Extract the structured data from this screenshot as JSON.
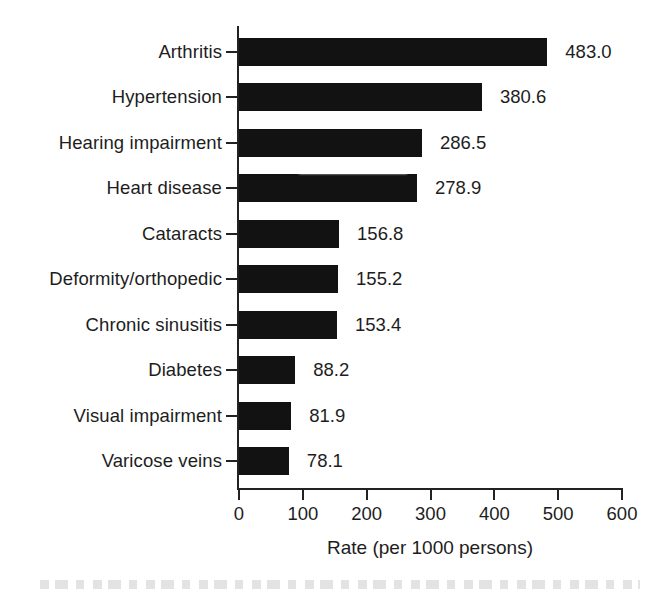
{
  "chart_data": {
    "type": "bar",
    "orientation": "horizontal",
    "title": "",
    "subtitle": "",
    "xlabel": "Rate (per 1000 persons)",
    "ylabel": "",
    "xlim": [
      0,
      600
    ],
    "xticks": [
      0,
      100,
      200,
      300,
      400,
      500,
      600
    ],
    "xtick_labels": [
      "0",
      "100",
      "200",
      "300",
      "400",
      "500",
      "600"
    ],
    "grid": false,
    "legend": null,
    "bar_color": "#121212",
    "categories": [
      "Arthritis",
      "Hypertension",
      "Hearing impairment",
      "Heart disease",
      "Cataracts",
      "Deformity/orthopedic",
      "Chronic sinusitis",
      "Diabetes",
      "Visual impairment",
      "Varicose veins"
    ],
    "values": [
      483.0,
      380.6,
      286.5,
      278.9,
      156.8,
      155.2,
      153.4,
      88.2,
      81.9,
      78.1
    ],
    "data_labels": [
      "483.0",
      "380.6",
      "286.5",
      "278.9",
      "156.8",
      "155.2",
      "153.4",
      "88.2",
      "81.9",
      "78.1"
    ],
    "bars": [
      {
        "category": "Arthritis",
        "value": 483.0,
        "label": "483.0"
      },
      {
        "category": "Hypertension",
        "value": 380.6,
        "label": "380.6"
      },
      {
        "category": "Hearing impairment",
        "value": 286.5,
        "label": "286.5"
      },
      {
        "category": "Heart disease",
        "value": 278.9,
        "label": "278.9"
      },
      {
        "category": "Cataracts",
        "value": 156.8,
        "label": "156.8"
      },
      {
        "category": "Deformity/orthopedic",
        "value": 155.2,
        "label": "155.2"
      },
      {
        "category": "Chronic sinusitis",
        "value": 153.4,
        "label": "153.4"
      },
      {
        "category": "Diabetes",
        "value": 88.2,
        "label": "88.2"
      },
      {
        "category": "Visual impairment",
        "value": 81.9,
        "label": "81.9"
      },
      {
        "category": "Varicose veins",
        "value": 78.1,
        "label": "78.1"
      }
    ]
  }
}
